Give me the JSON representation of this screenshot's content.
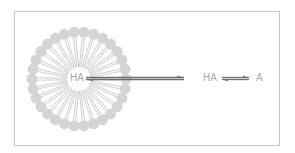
{
  "diagram": {
    "micelle_label": "HA",
    "outside_left_label": "HA",
    "outside_right_label": "A",
    "micelle": {
      "cx": 79,
      "cy": 79,
      "head_radius": 47,
      "head_size": 5.5,
      "head_count": 30,
      "head_color": "#d4d4d4",
      "tail_color": "#9a9a9a"
    },
    "arrow_color": "#6f6f6f",
    "frame_color": "#c4c4c4"
  }
}
